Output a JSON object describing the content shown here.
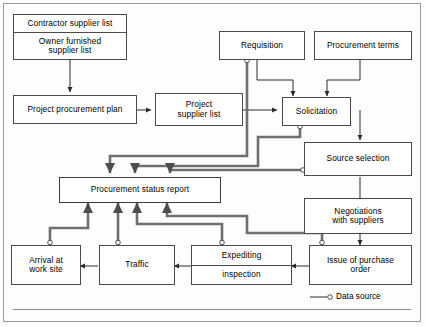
{
  "diagram": {
    "legend": {
      "label": "Data source",
      "marker": "circle-marker-icon"
    },
    "colors": {
      "node_border": "#4a4a4a",
      "thin_wire": "#2b2b2b",
      "thick_wire": "#6f6f6f",
      "frame": "#9b9b9b",
      "background": "#fdfdfd"
    },
    "nodes": [
      {
        "id": "contractor_supplier_list",
        "lines": [
          "Contractor supplier list"
        ]
      },
      {
        "id": "owner_furnished_supplier_list",
        "lines": [
          "Owner furnished",
          "supplier list"
        ]
      },
      {
        "id": "project_procurement_plan",
        "lines": [
          "Project procurement plan"
        ]
      },
      {
        "id": "project_supplier_list",
        "lines": [
          "Project",
          "supplier list"
        ]
      },
      {
        "id": "requisition",
        "lines": [
          "Requisition"
        ]
      },
      {
        "id": "procurement_terms",
        "lines": [
          "Procurement terms"
        ]
      },
      {
        "id": "solicitation",
        "lines": [
          "Solicitation"
        ]
      },
      {
        "id": "source_selection",
        "lines": [
          "Source selection"
        ]
      },
      {
        "id": "negotiations_with_suppliers",
        "lines": [
          "Negotiations",
          "with suppliers"
        ]
      },
      {
        "id": "issue_of_purchase_order",
        "lines": [
          "Issue of purchase",
          "order"
        ]
      },
      {
        "id": "procurement_status_report",
        "lines": [
          "Procurement status report"
        ]
      },
      {
        "id": "arrival_at_work_site",
        "lines": [
          "Arrival at",
          "work site"
        ]
      },
      {
        "id": "traffic",
        "lines": [
          "Traffic"
        ]
      },
      {
        "id": "expediting",
        "lines": [
          "Expediting"
        ]
      },
      {
        "id": "inspection",
        "lines": [
          "inspection"
        ]
      }
    ],
    "labels": {
      "contractor_supplier_list": "Contractor supplier list",
      "owner_furnished_l1": "Owner furnished",
      "owner_furnished_l2": "supplier list",
      "project_procurement_plan": "Project procurement plan",
      "project_supplier_list_l1": "Project",
      "project_supplier_list_l2": "supplier list",
      "requisition": "Requisition",
      "procurement_terms": "Procurement terms",
      "solicitation": "Solicitation",
      "source_selection": "Source selection",
      "negotiations_l1": "Negotiations",
      "negotiations_l2": "with suppliers",
      "issue_purchase_l1": "Issue of purchase",
      "issue_purchase_l2": "order",
      "procurement_status_report": "Procurement status report",
      "arrival_l1": "Arrival at",
      "arrival_l2": "work site",
      "traffic": "Traffic",
      "expediting": "Expediting",
      "inspection": "inspection",
      "legend_data_source": "Data source"
    },
    "edges": [
      {
        "from": "owner_furnished_supplier_list",
        "to": "project_procurement_plan",
        "style": "thin",
        "arrow": true
      },
      {
        "from": "project_procurement_plan",
        "to": "project_supplier_list",
        "style": "thin",
        "arrow": true
      },
      {
        "from": "project_supplier_list",
        "to": "solicitation",
        "style": "thin",
        "arrow": true
      },
      {
        "from": "requisition",
        "to": "solicitation",
        "style": "thin",
        "arrow": true
      },
      {
        "from": "procurement_terms",
        "to": "solicitation",
        "style": "thin",
        "arrow": true
      },
      {
        "from": "solicitation",
        "to": "source_selection",
        "style": "thin",
        "arrow": true
      },
      {
        "from": "source_selection",
        "to": "negotiations_with_suppliers",
        "style": "thin",
        "arrow": true
      },
      {
        "from": "negotiations_with_suppliers",
        "to": "issue_of_purchase_order",
        "style": "thin",
        "arrow": true
      },
      {
        "from": "issue_of_purchase_order",
        "to": "expediting",
        "style": "thin",
        "arrow": true
      },
      {
        "from": "inspection",
        "to": "traffic",
        "style": "thin",
        "arrow": true
      },
      {
        "from": "traffic",
        "to": "arrival_at_work_site",
        "style": "thin",
        "arrow": true
      },
      {
        "from": "requisition",
        "to": "procurement_status_report",
        "style": "thick",
        "arrow": true,
        "datasource": true
      },
      {
        "from": "solicitation",
        "to": "procurement_status_report",
        "style": "thick",
        "arrow": true,
        "datasource": true
      },
      {
        "from": "source_selection",
        "to": "procurement_status_report",
        "style": "thick",
        "arrow": true,
        "datasource": true
      },
      {
        "from": "arrival_at_work_site",
        "to": "procurement_status_report",
        "style": "thick",
        "arrow": true,
        "datasource": true
      },
      {
        "from": "traffic",
        "to": "procurement_status_report",
        "style": "thick",
        "arrow": true,
        "datasource": true
      },
      {
        "from": "expediting",
        "to": "procurement_status_report",
        "style": "thick",
        "arrow": true,
        "datasource": true
      },
      {
        "from": "issue_of_purchase_order",
        "to": "procurement_status_report",
        "style": "thick",
        "arrow": true,
        "datasource": true
      }
    ],
    "data_source_markers": [
      {
        "at": "requisition-bottom",
        "x": 247,
        "y": 61
      },
      {
        "at": "solicitation-bottom",
        "x": 300,
        "y": 127
      },
      {
        "at": "source-selection-left",
        "x": 303,
        "y": 170
      },
      {
        "at": "arrival-top",
        "x": 50,
        "y": 243
      },
      {
        "at": "traffic-top",
        "x": 118,
        "y": 243
      },
      {
        "at": "expediting-top",
        "x": 222,
        "y": 243
      },
      {
        "at": "issue-order-top",
        "x": 322,
        "y": 243
      }
    ]
  }
}
